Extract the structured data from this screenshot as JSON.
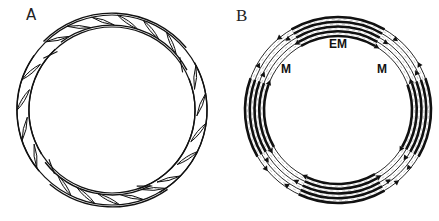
{
  "figure": {
    "panels": [
      {
        "id": "A",
        "label": "A",
        "description": "Ring of spindle-shaped stippled cells arranged in four overlapping arcs",
        "geometry": {
          "cx": 112,
          "cy": 110,
          "outer_r": 96,
          "inner_r": 84
        },
        "cell_clusters": [
          {
            "position": "top",
            "start_deg": 225,
            "end_deg": 320,
            "cells": 6
          },
          {
            "position": "right",
            "start_deg": 330,
            "end_deg": 60,
            "cells": 5
          },
          {
            "position": "bottom",
            "start_deg": 55,
            "end_deg": 130,
            "cells": 5
          },
          {
            "position": "left",
            "start_deg": 140,
            "end_deg": 215,
            "cells": 4
          }
        ]
      },
      {
        "id": "B",
        "label": "B",
        "description": "Concentric ring of lines with dark EM segments and light M segments separated by arrowheads",
        "geometry": {
          "cx": 118,
          "cy": 110,
          "outer_r": 93,
          "inner_r": 74,
          "line_count": 5
        },
        "region_labels": {
          "em": "EM",
          "m_left": "M",
          "m_right": "M"
        },
        "dark_segments": [
          {
            "name": "top",
            "start_deg": 240,
            "end_deg": 300
          },
          {
            "name": "right",
            "start_deg": 340,
            "end_deg": 30
          },
          {
            "name": "bottom",
            "start_deg": 60,
            "end_deg": 115
          },
          {
            "name": "left",
            "start_deg": 150,
            "end_deg": 200
          }
        ]
      }
    ]
  },
  "colors": {
    "line": "#111111",
    "stipple": "#9a9a9a",
    "background": "#ffffff"
  }
}
